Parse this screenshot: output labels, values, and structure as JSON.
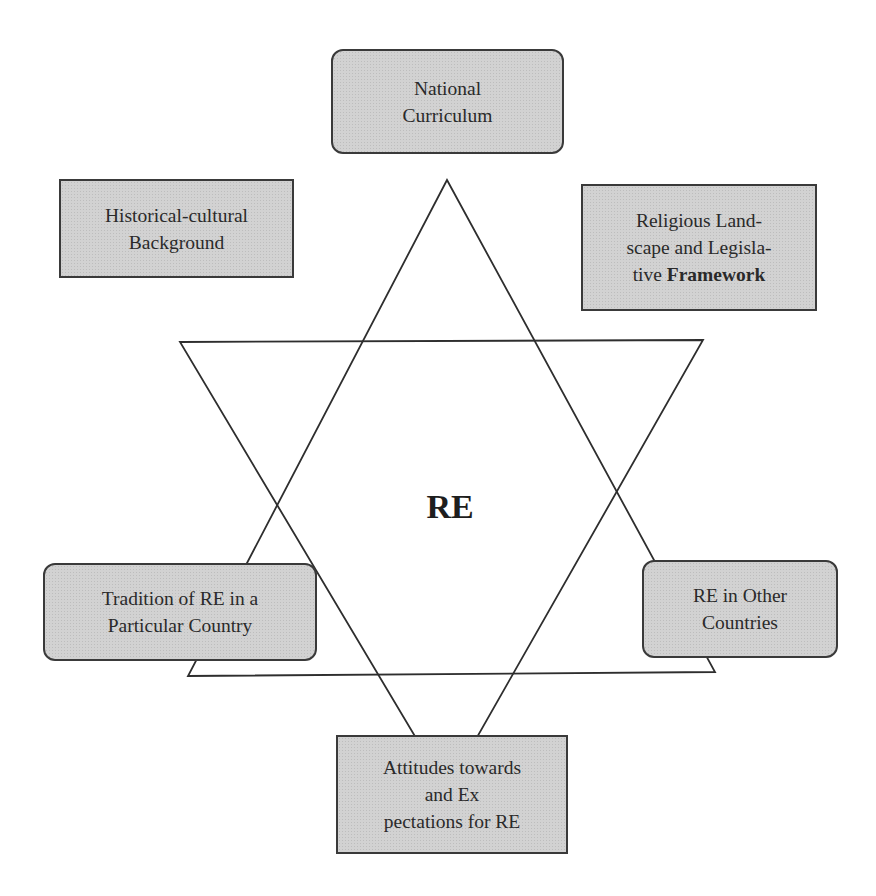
{
  "diagram": {
    "center_label": "RE",
    "nodes": {
      "national_curriculum": {
        "lines": [
          "National",
          "Curriculum"
        ]
      },
      "historical_cultural": {
        "lines": [
          "Historical-cultural",
          "Background"
        ]
      },
      "religious_landscape": {
        "lines": [
          "Religious Land-",
          "scape and Legisla-"
        ],
        "line3_prefix": "tive ",
        "line3_bold": "Framework"
      },
      "tradition": {
        "lines": [
          "Tradition of RE in a",
          "Particular Country"
        ]
      },
      "other_countries": {
        "lines": [
          "RE in Other",
          "Countries"
        ]
      },
      "attitudes": {
        "lines": [
          "Attitudes towards",
          "and Ex",
          "pectations for RE"
        ]
      }
    },
    "colors": {
      "box_fill": "#d2d2d2",
      "box_border": "#3a3a3a",
      "line": "#2e2e2e",
      "background": "#ffffff"
    }
  }
}
